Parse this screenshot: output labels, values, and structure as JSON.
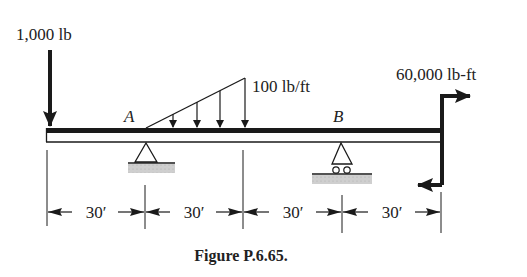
{
  "figure": {
    "caption": "Figure P.6.65.",
    "colors": {
      "ink": "#1a1a1a",
      "ground": "#c8c8c8"
    }
  },
  "loads": {
    "point_load": {
      "label": "1,000 lb",
      "direction": "down",
      "position_ft": 0
    },
    "distributed_load": {
      "label": "100 lb/ft",
      "shape": "triangular",
      "start_ft": 30,
      "end_ft": 60,
      "max_intensity": 100,
      "units": "lb/ft"
    },
    "couple": {
      "label": "60,000 lb-ft",
      "position_ft": 120
    }
  },
  "supports": {
    "A": {
      "label": "A",
      "type": "pin",
      "position_ft": 30
    },
    "B": {
      "label": "B",
      "type": "roller",
      "position_ft": 90
    }
  },
  "dimensions": {
    "segments": [
      {
        "label": "30′"
      },
      {
        "label": "30′"
      },
      {
        "label": "30′"
      },
      {
        "label": "30′"
      }
    ]
  }
}
